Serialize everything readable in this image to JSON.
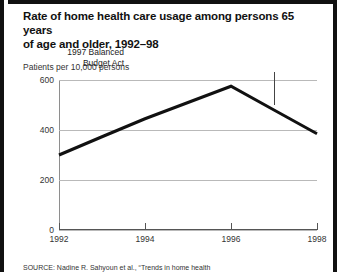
{
  "figure": {
    "title_line1": "Rate of home health care usage among persons 65 years",
    "title_line2": "of age and older, 1992–98",
    "source": "SOURCE: Nadine R. Sahyoun et al., “Trends in home health"
  },
  "annotation": {
    "line1": "1997 Balanced",
    "line2": "Budget Act",
    "at_year": 1997
  },
  "chart_data": {
    "type": "line",
    "title": "Rate of home health care usage among persons 65 years of age and older, 1992–98",
    "xlabel": "",
    "ylabel": "Patients per 10,000 persons",
    "x": [
      1992,
      1993,
      1994,
      1995,
      1996,
      1997,
      1998
    ],
    "series": [
      {
        "name": "Patients per 10,000 persons",
        "values": [
          300,
          373,
          445,
          510,
          575,
          480,
          385
        ]
      }
    ],
    "xlim": [
      1992,
      1998
    ],
    "ylim": [
      0,
      600
    ],
    "yticks": [
      0,
      200,
      400,
      600
    ],
    "ytick_labels": [
      "0",
      "200",
      "400",
      "600"
    ],
    "xticks": [
      1992,
      1994,
      1996,
      1998
    ],
    "xtick_labels": [
      "1992",
      "1994",
      "1996",
      "1998"
    ],
    "grid": true,
    "legend": "none",
    "line_color": "#111111",
    "grid_color": "#b9b9b9",
    "annotations": [
      {
        "text": "1997 Balanced Budget Act",
        "x": 1997
      }
    ]
  }
}
